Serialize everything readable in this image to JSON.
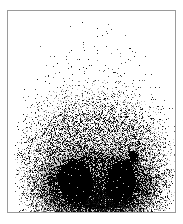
{
  "image": {
    "modality_label": "scintigraphy",
    "view_label": "posterior",
    "width": 183,
    "height": 224,
    "background_color": "#ffffff",
    "frame_color": "#9a9a9a",
    "speckle_color": "#000000",
    "frame": {
      "x": 7,
      "y": 10,
      "width": 169,
      "height": 203
    }
  },
  "scan": {
    "field": {
      "x": 8,
      "y": 11,
      "width": 167,
      "height": 201
    },
    "noise": {
      "seed": 20240517,
      "base_density": 0.0,
      "max_density": 0.95,
      "body_center_x": 95,
      "body_center_y": 150,
      "body_radius_x": 74,
      "body_radius_y": 125,
      "vertical_gradient_start_y": 30,
      "vertical_gradient_end_y": 205
    },
    "regions": [
      {
        "name": "left-kidney",
        "label": "left kidney uptake",
        "shape": "ellipse",
        "cx": 75,
        "cy": 181,
        "rx": 18,
        "ry": 24,
        "rotation_deg": -8,
        "intensity": 1.0
      },
      {
        "name": "right-kidney",
        "label": "right kidney uptake",
        "shape": "ellipse",
        "cx": 120,
        "cy": 181,
        "rx": 16,
        "ry": 23,
        "rotation_deg": 8,
        "intensity": 1.0
      },
      {
        "name": "focal-hot-spot",
        "label": "focal hot spot superior-lateral",
        "shape": "ellipse",
        "cx": 133,
        "cy": 156,
        "rx": 5,
        "ry": 6,
        "rotation_deg": 0,
        "intensity": 1.0
      },
      {
        "name": "hot-spot-bridge",
        "label": "bridge to right kidney",
        "shape": "ellipse",
        "cx": 128,
        "cy": 163,
        "rx": 4,
        "ry": 5,
        "rotation_deg": 0,
        "intensity": 0.85
      },
      {
        "name": "perirenal-halo",
        "label": "perirenal diffuse activity",
        "shape": "ellipse",
        "cx": 97,
        "cy": 182,
        "rx": 62,
        "ry": 34,
        "rotation_deg": 0,
        "intensity": 0.45
      },
      {
        "name": "soft-tissue-band",
        "label": "lower soft tissue background",
        "shape": "ellipse",
        "cx": 95,
        "cy": 150,
        "rx": 66,
        "ry": 48,
        "rotation_deg": 0,
        "intensity": 0.18
      }
    ]
  }
}
